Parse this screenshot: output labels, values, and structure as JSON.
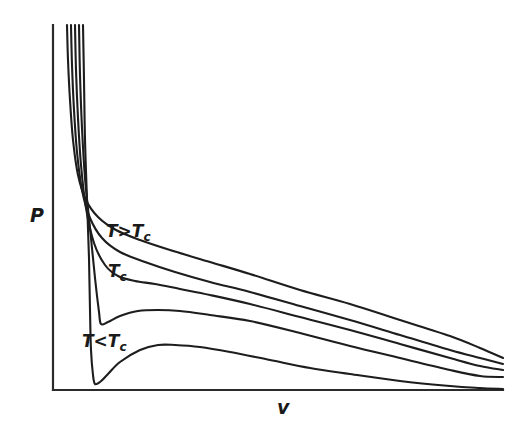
{
  "figure": {
    "background_color": "#ffffff",
    "line_color": "#1d1d1d",
    "axis_color": "#2b2b2b"
  },
  "axes": {
    "y_label": "P",
    "x_label": "v",
    "y_axis_name": "pressure-axis",
    "x_axis_name": "volume-axis"
  },
  "labels": {
    "above_critical": {
      "symbol": "T",
      "operator": ">",
      "ref_symbol": "T",
      "ref_sub": "c",
      "text": "T>Tc"
    },
    "critical": {
      "symbol": "T",
      "sub": "c",
      "text": "Tc"
    },
    "below_critical": {
      "symbol": "T",
      "operator": "<",
      "ref_symbol": "T",
      "ref_sub": "c",
      "text": "T<Tc"
    }
  },
  "chart_data": {
    "type": "line",
    "title": "",
    "xlabel": "v",
    "ylabel": "P",
    "grid": false,
    "legend": "inline-annotations",
    "xlim": [
      0,
      1
    ],
    "ylim": [
      0,
      1
    ],
    "axis_ticks": "none",
    "annotations": [
      {
        "text": "T>Tc",
        "x_px": 106,
        "y_px": 236
      },
      {
        "text": "Tc",
        "x_px": 108,
        "y_px": 276
      },
      {
        "text": "T<Tc",
        "x_px": 82,
        "y_px": 346
      }
    ],
    "series": [
      {
        "name": "T >> Tc (highest isotherm)",
        "relative_temperature": 1.15,
        "loop": false,
        "points_px": [
          [
            67,
            25
          ],
          [
            68,
            60
          ],
          [
            70,
            100
          ],
          [
            73,
            140
          ],
          [
            78,
            175
          ],
          [
            86,
            200
          ],
          [
            98,
            217
          ],
          [
            116,
            230
          ],
          [
            140,
            240
          ],
          [
            170,
            250
          ],
          [
            210,
            262
          ],
          [
            250,
            274
          ],
          [
            300,
            290
          ],
          [
            350,
            304
          ],
          [
            400,
            320
          ],
          [
            450,
            336
          ],
          [
            480,
            348
          ],
          [
            503,
            358
          ]
        ]
      },
      {
        "name": "T > Tc (second isotherm)",
        "relative_temperature": 1.07,
        "loop": false,
        "points_px": [
          [
            71,
            25
          ],
          [
            72,
            65
          ],
          [
            74,
            110
          ],
          [
            77,
            152
          ],
          [
            82,
            190
          ],
          [
            90,
            218
          ],
          [
            102,
            238
          ],
          [
            120,
            252
          ],
          [
            145,
            262
          ],
          [
            175,
            272
          ],
          [
            210,
            282
          ],
          [
            250,
            292
          ],
          [
            300,
            306
          ],
          [
            350,
            320
          ],
          [
            400,
            335
          ],
          [
            450,
            350
          ],
          [
            480,
            358
          ],
          [
            503,
            364
          ]
        ]
      },
      {
        "name": "Tc (critical isotherm)",
        "relative_temperature": 1.0,
        "loop": false,
        "inflection_px": [
          130,
          281
        ],
        "points_px": [
          [
            75,
            25
          ],
          [
            76,
            70
          ],
          [
            78,
            118
          ],
          [
            81,
            165
          ],
          [
            86,
            208
          ],
          [
            94,
            243
          ],
          [
            105,
            265
          ],
          [
            118,
            276
          ],
          [
            135,
            281
          ],
          [
            155,
            284
          ],
          [
            180,
            289
          ],
          [
            210,
            295
          ],
          [
            250,
            304
          ],
          [
            300,
            317
          ],
          [
            350,
            330
          ],
          [
            400,
            344
          ],
          [
            450,
            358
          ],
          [
            480,
            366
          ],
          [
            503,
            370
          ]
        ]
      },
      {
        "name": "T < Tc (fourth isotherm, shallow loop)",
        "relative_temperature": 0.94,
        "loop": true,
        "minimum_px": [
          101,
          324
        ],
        "maximum_px": [
          158,
          310
        ],
        "points_px": [
          [
            79,
            25
          ],
          [
            80,
            75
          ],
          [
            82,
            128
          ],
          [
            85,
            178
          ],
          [
            90,
            228
          ],
          [
            95,
            278
          ],
          [
            99,
            312
          ],
          [
            101,
            324
          ],
          [
            108,
            322
          ],
          [
            120,
            316
          ],
          [
            138,
            311
          ],
          [
            158,
            310
          ],
          [
            180,
            311
          ],
          [
            210,
            315
          ],
          [
            250,
            321
          ],
          [
            300,
            333
          ],
          [
            350,
            346
          ],
          [
            400,
            358
          ],
          [
            450,
            370
          ],
          [
            480,
            376
          ],
          [
            503,
            377
          ]
        ]
      },
      {
        "name": "T << Tc (lowest isotherm, deep loop)",
        "relative_temperature": 0.86,
        "loop": true,
        "minimum_px": [
          93,
          384
        ],
        "maximum_px": [
          168,
          345
        ],
        "points_px": [
          [
            83,
            25
          ],
          [
            84,
            80
          ],
          [
            85,
            140
          ],
          [
            87,
            200
          ],
          [
            89,
            258
          ],
          [
            90,
            310
          ],
          [
            91,
            350
          ],
          [
            93,
            375
          ],
          [
            95,
            384
          ],
          [
            100,
            382
          ],
          [
            108,
            374
          ],
          [
            120,
            362
          ],
          [
            140,
            350
          ],
          [
            158,
            345
          ],
          [
            175,
            345
          ],
          [
            200,
            347
          ],
          [
            230,
            352
          ],
          [
            270,
            360
          ],
          [
            310,
            368
          ],
          [
            350,
            374
          ],
          [
            400,
            381
          ],
          [
            450,
            386
          ],
          [
            480,
            388
          ],
          [
            503,
            389
          ]
        ]
      }
    ]
  }
}
